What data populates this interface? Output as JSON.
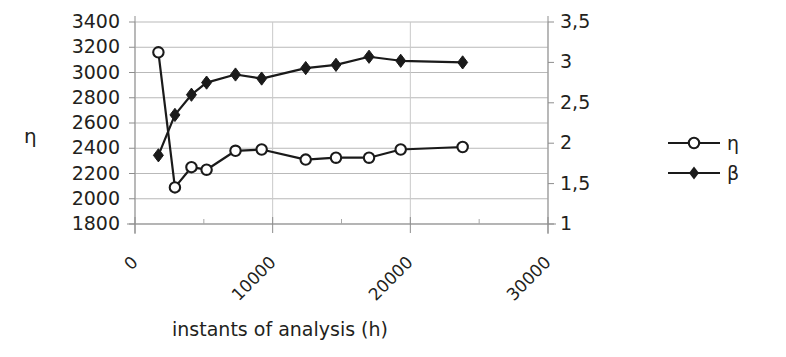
{
  "chart_data": {
    "type": "line",
    "title": "",
    "xlabel": "instants of analysis (h)",
    "ylabel": "η",
    "ylabel_right": "",
    "x": [
      1700,
      2900,
      4100,
      5200,
      7300,
      9200,
      12400,
      14600,
      17000,
      19300,
      23800
    ],
    "xlim": [
      0,
      30000
    ],
    "xticks": [
      0,
      10000,
      20000,
      30000
    ],
    "xticklabels": [
      "0",
      "10000",
      "20000",
      "30000"
    ],
    "ylim": [
      1800,
      3400
    ],
    "yticks": [
      1800,
      2000,
      2200,
      2400,
      2600,
      2800,
      3000,
      3200,
      3400
    ],
    "yticklabels": [
      "1800",
      "2000",
      "2200",
      "2400",
      "2600",
      "2800",
      "3000",
      "3200",
      "3400"
    ],
    "ylim_right": [
      1,
      3.5
    ],
    "yticks_right": [
      1,
      1.5,
      2,
      2.5,
      3,
      3.5
    ],
    "yticklabels_right": [
      "1",
      "1,5",
      "2",
      "2,5",
      "3",
      "3,5"
    ],
    "grid": true,
    "legend_position": "right",
    "series": [
      {
        "name": "η",
        "axis": "left",
        "marker": "open-circle",
        "color": "#1a1a1a",
        "x": [
          1700,
          2900,
          4100,
          5200,
          7300,
          9200,
          12400,
          14600,
          17000,
          19300,
          23800
        ],
        "values": [
          3160,
          2090,
          2250,
          2230,
          2380,
          2390,
          2310,
          2325,
          2325,
          2390,
          2410
        ]
      },
      {
        "name": "β",
        "axis": "right",
        "marker": "filled-diamond",
        "color": "#1a1a1a",
        "x": [
          1700,
          2900,
          4100,
          5200,
          7300,
          9200,
          12400,
          14600,
          17000,
          19300,
          23800
        ],
        "values": [
          1.85,
          2.35,
          2.6,
          2.75,
          2.85,
          2.8,
          2.93,
          2.97,
          3.07,
          3.02,
          3.0
        ]
      }
    ]
  },
  "legend": {
    "items": [
      {
        "label": "η",
        "marker": "open-circle"
      },
      {
        "label": "β",
        "marker": "filled-diamond"
      }
    ]
  },
  "axes": {
    "y_left_title": "η",
    "x_title": "instants of analysis (h)"
  }
}
